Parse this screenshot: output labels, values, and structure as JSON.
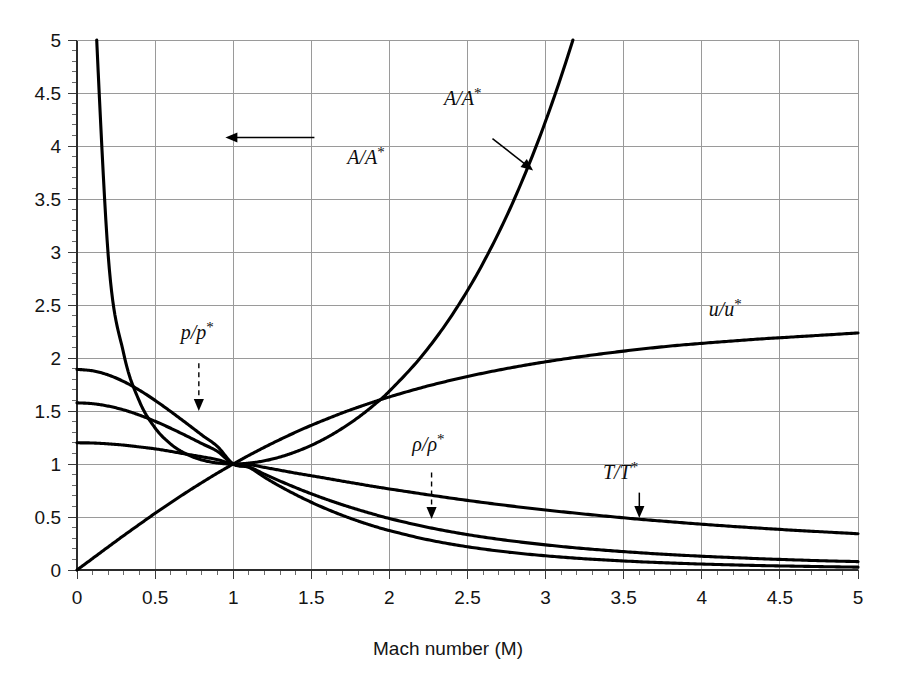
{
  "chart_data": {
    "type": "line",
    "title": "",
    "xlabel": "Mach number (M)",
    "ylabel": "",
    "xlim": [
      0,
      5
    ],
    "ylim": [
      0,
      5
    ],
    "grid": true,
    "legend_position": "inline-annotations",
    "x_ticks": [
      "0",
      "0.5",
      "1",
      "1.5",
      "2",
      "2.5",
      "3",
      "3.5",
      "4",
      "4.5",
      "5"
    ],
    "x_tick_values": [
      0,
      0.5,
      1,
      1.5,
      2,
      2.5,
      3,
      3.5,
      4,
      4.5,
      5
    ],
    "x_minor_step": 0.1,
    "y_ticks": [
      "0",
      "0.5",
      "1",
      "1.5",
      "2",
      "2.5",
      "3",
      "3.5",
      "4",
      "4.5",
      "5"
    ],
    "y_tick_values": [
      0,
      0.5,
      1,
      1.5,
      2,
      2.5,
      3,
      3.5,
      4,
      4.5,
      5
    ],
    "y_minor_step": 0.1,
    "x": [
      0,
      0.1,
      0.2,
      0.3,
      0.4,
      0.5,
      0.6,
      0.7,
      0.8,
      0.9,
      1,
      1.1,
      1.2,
      1.3,
      1.4,
      1.5,
      1.6,
      1.7,
      1.8,
      1.9,
      2,
      2.2,
      2.4,
      2.6,
      2.8,
      3,
      3.2,
      3.4,
      3.6,
      3.8,
      4,
      4.2,
      4.4,
      4.6,
      4.8,
      5
    ],
    "series": [
      {
        "name": "A/A*",
        "label": "A/A*",
        "values": [
          null,
          5.82,
          2.964,
          2.035,
          1.59,
          1.34,
          1.188,
          1.094,
          1.038,
          1.009,
          1.0,
          1.008,
          1.03,
          1.066,
          1.115,
          1.176,
          1.25,
          1.338,
          1.439,
          1.555,
          1.687,
          2.005,
          2.403,
          2.896,
          3.5,
          4.235,
          5.121,
          6.184,
          7.45,
          8.951,
          10.719,
          12.792,
          15.21,
          18.018,
          21.264,
          25.0
        ]
      },
      {
        "name": "p/p*",
        "label": "p/p*",
        "values": [
          1.893,
          1.879,
          1.84,
          1.777,
          1.696,
          1.6,
          1.495,
          1.385,
          1.273,
          1.164,
          1.0,
          0.968,
          0.875,
          0.789,
          0.711,
          0.639,
          0.574,
          0.515,
          0.462,
          0.414,
          0.372,
          0.3,
          0.243,
          0.198,
          0.162,
          0.134,
          0.111,
          0.093,
          0.078,
          0.066,
          0.056,
          0.048,
          0.041,
          0.036,
          0.031,
          0.027
        ]
      },
      {
        "name": "rho/rho*",
        "label": "ρ/ρ*",
        "values": [
          1.577,
          1.569,
          1.546,
          1.51,
          1.461,
          1.403,
          1.337,
          1.266,
          1.192,
          1.118,
          1.0,
          0.973,
          0.904,
          0.839,
          0.777,
          0.719,
          0.665,
          0.615,
          0.569,
          0.526,
          0.486,
          0.417,
          0.359,
          0.311,
          0.271,
          0.237,
          0.208,
          0.184,
          0.163,
          0.145,
          0.13,
          0.117,
          0.105,
          0.095,
          0.086,
          0.079
        ]
      },
      {
        "name": "T/T*",
        "label": "T/T*",
        "values": [
          1.2,
          1.198,
          1.19,
          1.178,
          1.161,
          1.143,
          1.119,
          1.093,
          1.068,
          1.041,
          1.0,
          0.995,
          0.968,
          0.941,
          0.914,
          0.889,
          0.864,
          0.838,
          0.813,
          0.788,
          0.765,
          0.72,
          0.677,
          0.637,
          0.6,
          0.566,
          0.535,
          0.506,
          0.479,
          0.455,
          0.432,
          0.411,
          0.392,
          0.374,
          0.358,
          0.342
        ]
      },
      {
        "name": "u/u*",
        "label": "u/u*",
        "values": [
          0.0,
          0.109,
          0.218,
          0.326,
          0.431,
          0.535,
          0.635,
          0.732,
          0.825,
          0.915,
          1.0,
          1.081,
          1.158,
          1.231,
          1.3,
          1.365,
          1.425,
          1.483,
          1.536,
          1.586,
          1.633,
          1.718,
          1.792,
          1.857,
          1.914,
          1.964,
          2.008,
          2.047,
          2.082,
          2.113,
          2.138,
          2.161,
          2.182,
          2.2,
          2.218,
          2.236
        ]
      }
    ],
    "annotations": [
      {
        "id": "a-over-a-star-left",
        "text": "A/A*",
        "base": "A/A",
        "sup": "*",
        "label_x": 1.85,
        "label_y": 3.83,
        "pointer": "arrow-left",
        "arrow_from_x": 1.52,
        "arrow_from_y": 4.08,
        "arrow_to_x": 0.95,
        "arrow_to_y": 4.08
      },
      {
        "id": "a-over-a-star-right",
        "text": "A/A*",
        "base": "A/A",
        "sup": "*",
        "label_x": 2.47,
        "label_y": 4.39,
        "pointer": "arrow-diagonal",
        "arrow_from_x": 2.66,
        "arrow_from_y": 4.07,
        "arrow_to_x": 2.92,
        "arrow_to_y": 3.77
      },
      {
        "id": "p-over-p-star",
        "text": "p/p*",
        "base": "p/p",
        "sup": "*",
        "label_x": 0.77,
        "label_y": 2.18,
        "pointer": "arrow-down-dashed",
        "arrow_from_x": 0.78,
        "arrow_from_y": 1.95,
        "arrow_to_x": 0.78,
        "arrow_to_y": 1.5
      },
      {
        "id": "rho-over-rho-star",
        "text": "ρ/ρ*",
        "base": "ρ/ρ",
        "sup": "*",
        "label_x": 2.25,
        "label_y": 1.12,
        "pointer": "arrow-down-dashed",
        "arrow_from_x": 2.27,
        "arrow_from_y": 0.92,
        "arrow_to_x": 2.27,
        "arrow_to_y": 0.48
      },
      {
        "id": "t-over-t-star",
        "text": "T/T*",
        "base": "T/T",
        "sup": "*",
        "label_x": 3.48,
        "label_y": 0.86,
        "pointer": "arrow-down-solid",
        "arrow_from_x": 3.6,
        "arrow_from_y": 0.73,
        "arrow_to_x": 3.6,
        "arrow_to_y": 0.49
      },
      {
        "id": "u-over-u-star",
        "text": "u/u*",
        "base": "u/u",
        "sup": "*",
        "label_x": 4.15,
        "label_y": 2.4,
        "pointer": "none"
      }
    ]
  },
  "colors": {
    "curve": "#000000",
    "grid": "#9a9a9a",
    "axis": "#2b2b2b",
    "text": "#141414",
    "background": "#ffffff"
  }
}
